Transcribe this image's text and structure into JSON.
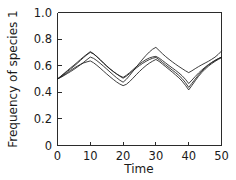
{
  "chart_data": {
    "type": "line",
    "title": "",
    "xlabel": "Time",
    "ylabel": "Frequency of species 1",
    "xlim": [
      0,
      50
    ],
    "ylim": [
      0,
      1.0
    ],
    "xticks": [
      0,
      10,
      20,
      30,
      40,
      50
    ],
    "yticks": [
      0,
      0.2,
      0.4,
      0.6,
      0.8,
      1.0
    ],
    "xtick_labels": [
      "0",
      "10",
      "20",
      "30",
      "40",
      "50"
    ],
    "ytick_labels": [
      "0",
      "0.2",
      "0.4",
      "0.6",
      "0.8",
      "1.0"
    ],
    "grid": false,
    "legend": false,
    "legend_position": "none",
    "line_color": "#1b1b1b",
    "x": [
      0,
      1,
      2,
      3,
      4,
      5,
      6,
      7,
      8,
      9,
      10,
      11,
      12,
      13,
      14,
      15,
      16,
      17,
      18,
      19,
      20,
      21,
      22,
      23,
      24,
      25,
      26,
      27,
      28,
      29,
      30,
      31,
      32,
      33,
      34,
      35,
      36,
      37,
      38,
      39,
      40,
      41,
      42,
      43,
      44,
      45,
      46,
      47,
      48,
      49,
      50
    ],
    "series": [
      {
        "name": "replicate-1",
        "values": [
          0.5,
          0.519,
          0.538,
          0.557,
          0.576,
          0.596,
          0.617,
          0.64,
          0.662,
          0.683,
          0.7,
          0.688,
          0.668,
          0.645,
          0.62,
          0.596,
          0.575,
          0.556,
          0.539,
          0.524,
          0.512,
          0.528,
          0.548,
          0.57,
          0.592,
          0.612,
          0.63,
          0.646,
          0.658,
          0.666,
          0.67,
          0.657,
          0.639,
          0.62,
          0.601,
          0.583,
          0.565,
          0.546,
          0.524,
          0.498,
          0.466,
          0.492,
          0.519,
          0.545,
          0.568,
          0.589,
          0.608,
          0.625,
          0.64,
          0.653,
          0.665
        ]
      },
      {
        "name": "replicate-2",
        "values": [
          0.5,
          0.521,
          0.542,
          0.563,
          0.584,
          0.604,
          0.625,
          0.647,
          0.668,
          0.687,
          0.706,
          0.69,
          0.668,
          0.645,
          0.622,
          0.599,
          0.577,
          0.557,
          0.538,
          0.521,
          0.506,
          0.521,
          0.541,
          0.562,
          0.582,
          0.601,
          0.618,
          0.633,
          0.646,
          0.656,
          0.662,
          0.645,
          0.625,
          0.605,
          0.586,
          0.567,
          0.548,
          0.527,
          0.503,
          0.473,
          0.437,
          0.468,
          0.5,
          0.531,
          0.559,
          0.583,
          0.604,
          0.622,
          0.638,
          0.652,
          0.664
        ]
      },
      {
        "name": "replicate-3",
        "values": [
          0.5,
          0.515,
          0.531,
          0.548,
          0.565,
          0.581,
          0.596,
          0.61,
          0.621,
          0.629,
          0.636,
          0.622,
          0.603,
          0.582,
          0.56,
          0.538,
          0.517,
          0.497,
          0.478,
          0.462,
          0.45,
          0.46,
          0.481,
          0.506,
          0.532,
          0.557,
          0.58,
          0.601,
          0.619,
          0.634,
          0.647,
          0.632,
          0.612,
          0.592,
          0.572,
          0.552,
          0.531,
          0.509,
          0.484,
          0.453,
          0.418,
          0.452,
          0.487,
          0.52,
          0.549,
          0.574,
          0.596,
          0.615,
          0.632,
          0.647,
          0.66
        ]
      },
      {
        "name": "replicate-4",
        "values": [
          0.5,
          0.512,
          0.526,
          0.541,
          0.556,
          0.572,
          0.589,
          0.607,
          0.626,
          0.646,
          0.665,
          0.655,
          0.638,
          0.618,
          0.597,
          0.575,
          0.553,
          0.531,
          0.51,
          0.491,
          0.476,
          0.498,
          0.527,
          0.558,
          0.589,
          0.62,
          0.65,
          0.678,
          0.703,
          0.724,
          0.738,
          0.714,
          0.69,
          0.668,
          0.648,
          0.629,
          0.611,
          0.594,
          0.578,
          0.562,
          0.548,
          0.562,
          0.578,
          0.593,
          0.607,
          0.62,
          0.633,
          0.648,
          0.664,
          0.685,
          0.71
        ]
      }
    ]
  }
}
